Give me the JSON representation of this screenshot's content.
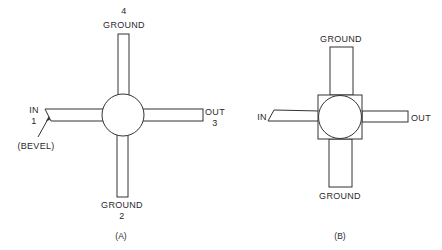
{
  "figure_a": {
    "caption": "(A)",
    "top_label_num": "4",
    "top_label": "GROUND",
    "left_label": "IN",
    "left_label_num": "1",
    "bevel_label": "(BEVEL)",
    "right_label": "OUT",
    "right_label_num": "3",
    "bottom_label": "GROUND",
    "bottom_label_num": "2"
  },
  "figure_b": {
    "caption": "(B)",
    "top_label": "GROUND",
    "left_label": "IN",
    "right_label": "OUT",
    "bottom_label": "GROUND"
  },
  "colors": {
    "line": "#333333",
    "text": "#2a2a2a",
    "background": "#ffffff"
  }
}
